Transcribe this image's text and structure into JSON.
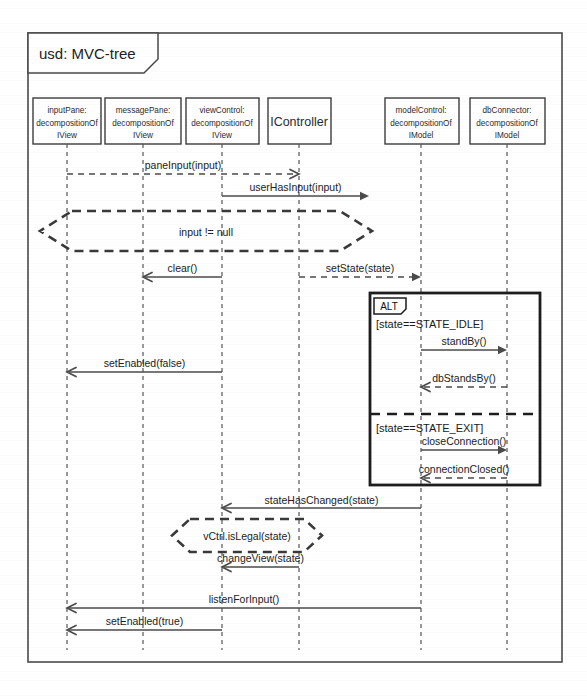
{
  "diagram": {
    "kind": "uml-sequence-diagram",
    "frame_title": "usd: MVC-tree",
    "colors": {
      "background": "#ffffff",
      "line": "#4b4b4b",
      "frame": "#4a4a4a",
      "alt_border": "#1d1d1d",
      "text": "#222222"
    },
    "frame": {
      "x": 28,
      "y": 33,
      "width": 534,
      "height": 629
    },
    "lifelines": [
      {
        "id": "inputPane",
        "lines": [
          "inputPane:",
          "decompositionOf",
          "IView"
        ],
        "box": {
          "x": 33,
          "y": 98,
          "width": 68,
          "height": 46
        },
        "center_x": 67,
        "style": "small"
      },
      {
        "id": "messagePane",
        "lines": [
          "messagePane:",
          "decompositionOf",
          "IView"
        ],
        "box": {
          "x": 105,
          "y": 98,
          "width": 76,
          "height": 46
        },
        "center_x": 143,
        "style": "small"
      },
      {
        "id": "viewControl",
        "lines": [
          "viewControl:",
          "decompositionOf",
          "IView"
        ],
        "box": {
          "x": 186,
          "y": 98,
          "width": 73,
          "height": 46
        },
        "center_x": 222,
        "style": "small"
      },
      {
        "id": "IController",
        "lines": [
          "IController"
        ],
        "box": {
          "x": 268,
          "y": 98,
          "width": 63,
          "height": 46
        },
        "center_x": 299,
        "style": "big"
      },
      {
        "id": "modelControl",
        "lines": [
          "modelControl:",
          "decompositionOf",
          "IModel"
        ],
        "box": {
          "x": 385,
          "y": 98,
          "width": 74,
          "height": 46
        },
        "center_x": 421,
        "style": "small"
      },
      {
        "id": "dbConnector",
        "lines": [
          "dbConnector:",
          "decompositionOf",
          "IModel"
        ],
        "box": {
          "x": 470,
          "y": 98,
          "width": 75,
          "height": 46
        },
        "center_x": 507,
        "style": "small"
      }
    ],
    "lifeline_bottom": 650,
    "messages": [
      {
        "label": "paneInput(input)",
        "from": "inputPane",
        "to": "viewControl",
        "y": 174,
        "style": "dashed",
        "head": "open",
        "label_dx": 0,
        "label_dy": -5,
        "from_x": 67,
        "to_x": 299
      },
      {
        "label": "userHasInput(input)",
        "from": "viewControl",
        "to": "IController",
        "y": 196,
        "style": "solid",
        "head": "filled",
        "label_dx": 0,
        "label_dy": -5,
        "from_x": 222,
        "to_x": 369
      },
      {
        "label": "clear()",
        "from": "viewControl",
        "to": "messagePane",
        "y": 277,
        "style": "solid",
        "head": "open",
        "label_dx": 0,
        "label_dy": -5,
        "from_x": 222,
        "to_x": 143
      },
      {
        "label": "setState(state)",
        "from": "IController",
        "to": "modelControl",
        "y": 277,
        "style": "dashed",
        "head": "filled",
        "label_dx": 0,
        "label_dy": -5,
        "from_x": 299,
        "to_x": 421
      },
      {
        "label": "standBy()",
        "from": "modelControl",
        "to": "dbConnector",
        "y": 350,
        "style": "solid",
        "head": "filled",
        "label_dx": 0,
        "label_dy": -5,
        "from_x": 421,
        "to_x": 507
      },
      {
        "label": "setEnabled(false)",
        "from": "viewControl",
        "to": "inputPane",
        "y": 372,
        "style": "solid",
        "head": "open",
        "label_dx": 0,
        "label_dy": -5,
        "from_x": 222,
        "to_x": 67
      },
      {
        "label": "dbStandsBy()",
        "from": "dbConnector",
        "to": "modelControl",
        "y": 387,
        "style": "dashed",
        "head": "open",
        "label_dx": 0,
        "label_dy": -5,
        "from_x": 507,
        "to_x": 421
      },
      {
        "label": "closeConnection()",
        "from": "modelControl",
        "to": "dbConnector",
        "y": 450,
        "style": "solid",
        "head": "filled",
        "label_dx": 0,
        "label_dy": -5,
        "from_x": 421,
        "to_x": 507
      },
      {
        "label": "connectionClosed()",
        "from": "dbConnector",
        "to": "modelControl",
        "y": 478,
        "style": "dashed",
        "head": "open",
        "label_dx": 0,
        "label_dy": -5,
        "from_x": 507,
        "to_x": 421
      },
      {
        "label": "stateHasChanged(state)",
        "from": "modelControl",
        "to": "viewControl",
        "y": 508,
        "style": "solid",
        "head": "open",
        "label_dx": 0,
        "label_dy": -4,
        "from_x": 421,
        "to_x": 222
      },
      {
        "label": "changeView(state)",
        "from": "IController",
        "to": "viewControl",
        "y": 567,
        "style": "solid",
        "head": "open",
        "label_dx": 0,
        "label_dy": -5,
        "from_x": 299,
        "to_x": 222
      },
      {
        "label": "listenForInput()",
        "from": "modelControl",
        "to": "inputPane",
        "y": 608,
        "style": "solid",
        "head": "open",
        "label_dx": 0,
        "label_dy": -5,
        "from_x": 421,
        "to_x": 67
      },
      {
        "label": "setEnabled(true)",
        "from": "viewControl",
        "to": "inputPane",
        "y": 630,
        "style": "solid",
        "head": "open",
        "label_dx": 0,
        "label_dy": -5,
        "from_x": 222,
        "to_x": 67
      }
    ],
    "conditions": [
      {
        "label": "input != null",
        "x": 40,
        "y": 211,
        "width": 332,
        "height": 40,
        "notch": 32,
        "label_x": 206,
        "label_y": 236
      },
      {
        "label": "vCtrl.isLegal(state)",
        "x": 172,
        "y": 519,
        "width": 150,
        "height": 33,
        "notch": 18,
        "label_x": 247,
        "label_y": 540
      }
    ],
    "combined_fragment": {
      "operator": "ALT",
      "box": {
        "x": 370,
        "y": 293,
        "width": 170,
        "height": 192
      },
      "tab": {
        "width": 32,
        "height": 16
      },
      "guards": [
        {
          "text": "[state==STATE_IDLE]",
          "x": 376,
          "y": 328
        },
        {
          "text": "[state==STATE_EXIT]",
          "x": 376,
          "y": 432
        }
      ],
      "dividers": [
        {
          "y": 414
        }
      ]
    }
  }
}
